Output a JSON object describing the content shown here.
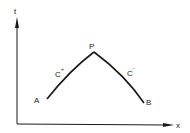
{
  "diagram": {
    "axes": {
      "vertical_label": "t",
      "horizontal_label": "x"
    },
    "points": {
      "A": "A",
      "P": "P",
      "B": "B"
    },
    "curves": {
      "left": {
        "base": "C",
        "superscript": "+"
      },
      "right": {
        "base": "C",
        "superscript": "-"
      }
    },
    "colors": {
      "stroke": "#1a1a1a"
    }
  }
}
